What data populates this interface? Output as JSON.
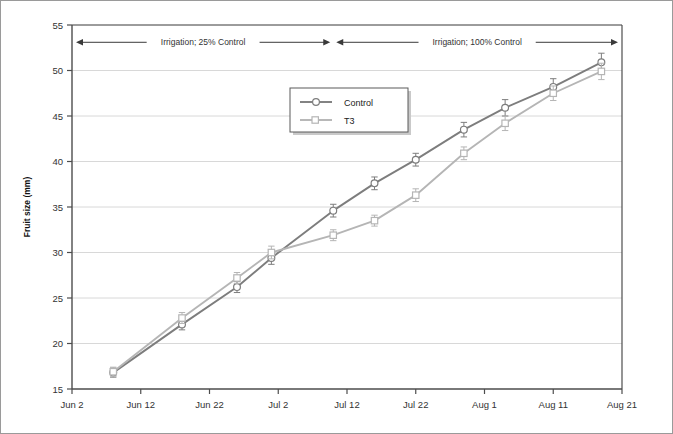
{
  "chart_data": {
    "type": "line",
    "title": "",
    "xlabel": "",
    "ylabel": "Fruit size (mm)",
    "ylim": [
      15,
      55
    ],
    "ytick_values": [
      15,
      20,
      25,
      30,
      35,
      40,
      45,
      50,
      55
    ],
    "ytick_labels": [
      "15",
      "20",
      "25",
      "30",
      "35",
      "40",
      "45",
      "50",
      "55"
    ],
    "xtick_labels": [
      "Jun 2",
      "Jun 12",
      "Jun 22",
      "Jul 2",
      "Jul 12",
      "Jul 22",
      "Aug 1",
      "Aug 11",
      "Aug 21"
    ],
    "xtick_days": [
      0,
      10,
      20,
      30,
      40,
      50,
      60,
      70,
      80
    ],
    "xlim_days": [
      0,
      80
    ],
    "grid": "horizontal",
    "legend_position": "upper-center",
    "x_days": [
      6,
      16,
      24,
      30,
      40,
      46,
      55,
      62,
      70,
      77
    ],
    "x_date_labels": [
      "Jun 8",
      "Jun 18",
      "Jun 26",
      "Jul 2",
      "Jul 12",
      "Jul 18",
      "Jul 27",
      "Aug 3",
      "Aug 11",
      "Aug 18"
    ],
    "series": [
      {
        "name": "Control",
        "color": "#7d7d7d",
        "marker": "circle",
        "values": [
          16.8,
          22.1,
          26.2,
          29.4,
          34.6,
          37.6,
          40.2,
          43.5,
          45.9,
          48.2,
          50.9
        ],
        "errors": [
          0.5,
          0.6,
          0.6,
          0.7,
          0.7,
          0.7,
          0.7,
          0.8,
          0.9,
          0.9,
          1.0
        ],
        "x_days_full": [
          6,
          16,
          24,
          29,
          38,
          44,
          50,
          57,
          63,
          70,
          77
        ]
      },
      {
        "name": "T3",
        "color": "#b5b5b5",
        "marker": "square",
        "values": [
          16.9,
          22.8,
          27.2,
          30.0,
          31.9,
          33.5,
          36.3,
          40.9,
          44.2,
          47.5,
          49.9
        ],
        "errors": [
          0.5,
          0.6,
          0.6,
          0.7,
          0.6,
          0.6,
          0.7,
          0.7,
          0.8,
          0.8,
          0.9
        ],
        "x_days_full": [
          6,
          16,
          24,
          29,
          38,
          44,
          50,
          57,
          63,
          70,
          77
        ]
      }
    ],
    "annotations": [
      {
        "text": "Irrigation; 25% Control",
        "start_day": 0,
        "end_day": 38,
        "y_value": 53.1
      },
      {
        "text": "Irrigation; 100% Control",
        "start_day": 38,
        "end_day": 80,
        "y_value": 53.1
      }
    ]
  },
  "legend": {
    "entries": [
      {
        "label": "Control"
      },
      {
        "label": "T3"
      }
    ]
  },
  "colors": {
    "control": "#7d7d7d",
    "t3": "#b5b5b5",
    "axis": "#4d4d4d",
    "grid": "#d8d8d8",
    "text": "#333333"
  }
}
